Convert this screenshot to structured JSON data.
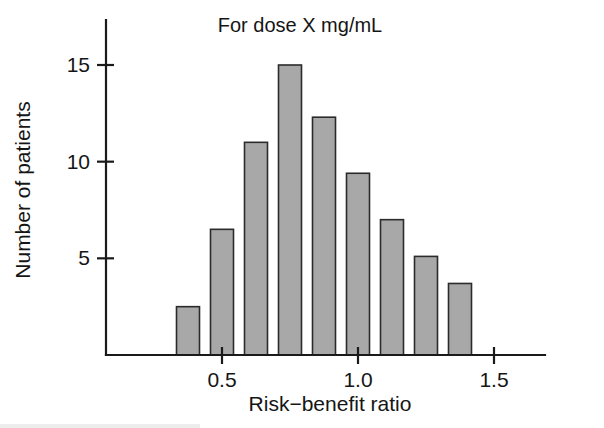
{
  "figure": {
    "background_color": "#ffffff",
    "ink_color": "#151515",
    "bar_fill_color": "#a8a8a8",
    "bar_edge_color": "#2b2b2b"
  },
  "chart_data": {
    "type": "bar",
    "title": "For dose X mg/mL",
    "xlabel": "Risk−benefit ratio",
    "ylabel": "Number of patients",
    "subtitle": "",
    "grid": false,
    "legend": "none",
    "xlim": [
      0.0,
      1.65
    ],
    "ylim": [
      0,
      16.5
    ],
    "bin_width": 0.125,
    "x_tick_labels": [
      "0.5",
      "1.0",
      "1.5"
    ],
    "x_ticks": [
      0.5,
      1.0,
      1.5
    ],
    "y_tick_labels": [
      "5",
      "10",
      "15"
    ],
    "y_ticks": [
      5,
      10,
      15
    ],
    "categories": [
      "0.375",
      "0.500",
      "0.625",
      "0.750",
      "0.875",
      "1.000",
      "1.125",
      "1.250",
      "1.375"
    ],
    "bin_starts": [
      0.3125,
      0.4375,
      0.5625,
      0.6875,
      0.8125,
      0.9375,
      1.0625,
      1.1875,
      1.3125
    ],
    "bin_ends": [
      0.4375,
      0.5625,
      0.6875,
      0.8125,
      0.9375,
      1.0625,
      1.1875,
      1.3125,
      1.4375
    ],
    "values": [
      2.5,
      6.5,
      11.0,
      15.0,
      12.3,
      9.4,
      7.0,
      5.1,
      3.7
    ],
    "series": [
      {
        "name": "Number of patients",
        "values": [
          2.5,
          6.5,
          11.0,
          15.0,
          12.3,
          9.4,
          7.0,
          5.1,
          3.7
        ]
      }
    ]
  }
}
